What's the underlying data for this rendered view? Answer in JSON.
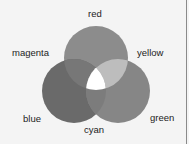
{
  "diagram": {
    "type": "venn-color-mixing",
    "circles": [
      {
        "name": "red",
        "cx": 96,
        "cy": 58,
        "r": 32,
        "fill": "#8c8c8c"
      },
      {
        "name": "blue",
        "cx": 74,
        "cy": 91,
        "r": 32,
        "fill": "#6a6a6a"
      },
      {
        "name": "green",
        "cx": 118,
        "cy": 91,
        "r": 32,
        "fill": "#868686"
      }
    ],
    "overlaps": {
      "magenta": "#777777",
      "yellow": "#bdbdbd",
      "cyan": "#7c7c7c",
      "center": "#ffffff"
    },
    "labels": {
      "red": "red",
      "magenta": "magenta",
      "yellow": "yellow",
      "blue": "blue",
      "cyan": "cyan",
      "green": "green"
    }
  }
}
